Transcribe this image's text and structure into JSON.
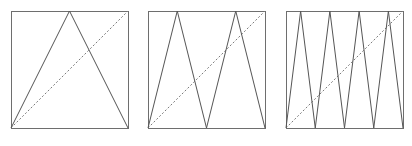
{
  "figure": {
    "canvas": {
      "width": 412,
      "height": 146
    },
    "background_color": "#ffffff",
    "border_color": "#6e6e6e",
    "zigzag_color": "#555555",
    "diagonal_color": "#7a7a7a",
    "diagonal_style": "dashed",
    "stroke_width": 1,
    "panel_count": 3,
    "panels": [
      {
        "name": "panel-1",
        "peaks": 1,
        "square": {
          "x": 11,
          "y": 11,
          "size": 117
        },
        "diagonal": {
          "from": [
            11,
            128
          ],
          "to": [
            128,
            11
          ]
        },
        "zigzag_points": "11,128 69.5,11 128,128",
        "bottom_nodes": [
          11,
          128
        ],
        "apex_x": [
          69.5
        ]
      },
      {
        "name": "panel-2",
        "peaks": 2,
        "square": {
          "x": 148,
          "y": 11,
          "size": 117
        },
        "diagonal": {
          "from": [
            148,
            128
          ],
          "to": [
            265,
            11
          ]
        },
        "zigzag_points": "148,128 177.25,11 206.5,128 235.75,11 265,128",
        "bottom_nodes": [
          148,
          206.5,
          265
        ],
        "apex_x": [
          177.25,
          235.75
        ]
      },
      {
        "name": "panel-3",
        "peaks": 4,
        "square": {
          "x": 286,
          "y": 11,
          "size": 117
        },
        "diagonal": {
          "from": [
            286,
            128
          ],
          "to": [
            403,
            11
          ]
        },
        "zigzag_points": "286,128 300.625,11 315.25,128 329.875,11 344.5,128 359.125,11 373.75,128 388.375,11 403,128",
        "bottom_nodes": [
          286,
          315.25,
          344.5,
          373.75,
          403
        ],
        "apex_x": [
          300.625,
          329.875,
          359.125,
          388.375
        ]
      }
    ]
  }
}
